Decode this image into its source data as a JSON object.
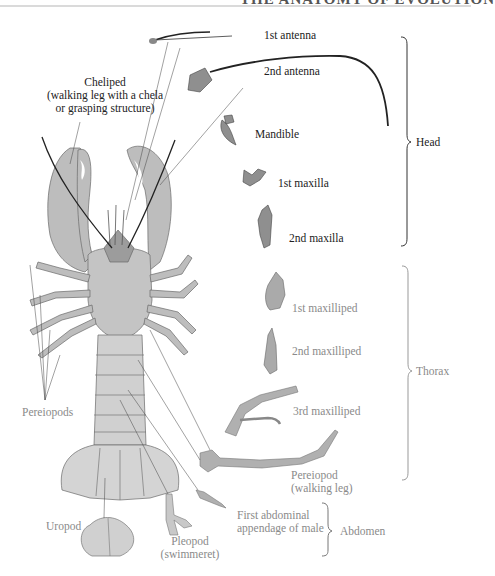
{
  "header": {
    "running_title_fragment": "THE ANATOMY OF EVOLUTION"
  },
  "figure": {
    "labels": {
      "cheliped": [
        "Cheliped",
        "(walking leg with a chela",
        "or grasping structure)"
      ],
      "pereiopods": "Pereiopods",
      "first_antenna": "1st antenna",
      "second_antenna": "2nd antenna",
      "mandible": "Mandible",
      "first_maxilla": "1st maxilla",
      "second_maxilla": "2nd maxilla",
      "first_maxilliped": "1st maxilliped",
      "second_maxilliped": "2nd maxilliped",
      "third_maxilliped": "3rd maxilliped",
      "pereiopod_walking_leg": [
        "Pereiopod",
        "(walking leg)"
      ],
      "uropod": "Uropod",
      "pleopod": [
        "Pleopod",
        "(swimmeret)"
      ],
      "first_abdominal_appendage": [
        "First abdominal",
        "appendage of male"
      ]
    },
    "regions": {
      "head": "Head",
      "thorax": "Thorax",
      "abdomen": "Abdomen"
    },
    "colors": {
      "head_text": "#222222",
      "thorax_text": "#8a8a8a",
      "body_fill": "#bdbdbd",
      "appendage_fill": "#9a9a9a",
      "outline": "#555555"
    }
  }
}
